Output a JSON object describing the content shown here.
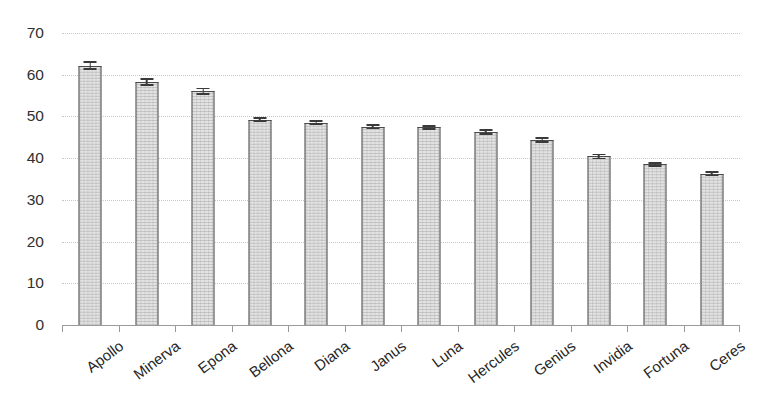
{
  "chart_data": {
    "type": "bar",
    "title": "",
    "subtitle": "",
    "xlabel": "",
    "ylabel": "",
    "ylim": [
      0,
      70
    ],
    "yticks": [
      0,
      10,
      20,
      30,
      40,
      50,
      60,
      70
    ],
    "ytick_labels": [
      "0",
      "10",
      "20",
      "30",
      "40",
      "50",
      "60",
      "70"
    ],
    "grid": true,
    "grid_axis": "y",
    "legend": false,
    "legend_position": "none",
    "error_bars": true,
    "categories": [
      "Apollo",
      "Minerva",
      "Epona",
      "Bellona",
      "Diana",
      "Janus",
      "Luna",
      "Hercules",
      "Genius",
      "Invidia",
      "Fortuna",
      "Ceres"
    ],
    "values": [
      62.2,
      58.3,
      56.0,
      49.2,
      48.5,
      47.5,
      47.4,
      46.2,
      44.3,
      40.4,
      38.5,
      36.2
    ],
    "errors": [
      1.1,
      0.9,
      0.9,
      0.6,
      0.6,
      0.6,
      0.6,
      0.7,
      0.7,
      0.7,
      0.6,
      0.6
    ],
    "series": [
      {
        "name": "value",
        "values": [
          62.2,
          58.3,
          56.0,
          49.2,
          48.5,
          47.5,
          47.4,
          46.2,
          44.3,
          40.4,
          38.5,
          36.2
        ],
        "errors": [
          1.1,
          0.9,
          0.9,
          0.6,
          0.6,
          0.6,
          0.6,
          0.7,
          0.7,
          0.7,
          0.6,
          0.6
        ]
      }
    ],
    "colors": {
      "bar_fill": "#e2e2e2",
      "bar_border": "#4a4a4a",
      "error_bar": "#3a3a3a",
      "gridline": "#c8c8c8",
      "axis": "#9a9a9a",
      "tick_label": "#303030",
      "background": "#ffffff"
    }
  }
}
